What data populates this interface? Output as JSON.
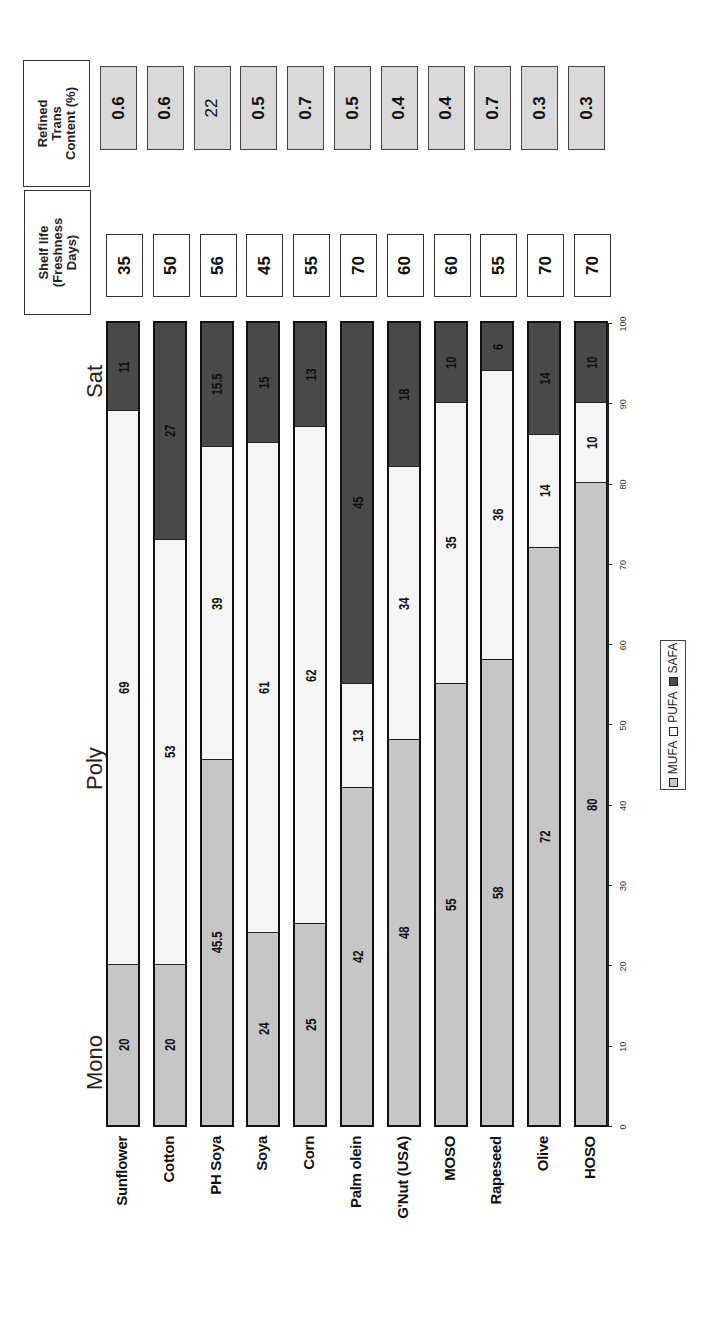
{
  "chart_data": {
    "type": "bar",
    "orientation": "horizontal-stacked (image rotated 90° counter-clockwise)",
    "categories": [
      "Sunflower",
      "Cotton",
      "PH Soya",
      "Soya",
      "Corn",
      "Palm olein",
      "G'Nut (USA)",
      "MOSO",
      "Rapeseed",
      "Olive",
      "HOSO"
    ],
    "series": [
      {
        "name": "MUFA",
        "color": "#c6c6c6",
        "values": [
          20,
          20,
          45.5,
          24,
          25,
          42,
          48,
          55,
          58,
          72,
          80
        ]
      },
      {
        "name": "PUFA",
        "color": "#f5f5f5",
        "values": [
          69,
          53,
          39,
          61,
          62,
          13,
          34,
          35,
          36,
          14,
          10
        ]
      },
      {
        "name": "SAFA",
        "color": "#4a4a4a",
        "values": [
          11,
          27,
          15.5,
          15,
          13,
          45,
          18,
          10,
          6,
          14,
          10
        ]
      }
    ],
    "group_labels": [
      "Mono",
      "Poly",
      "Sat"
    ],
    "xlim": [
      0,
      100
    ],
    "ticks": [
      "0",
      "10",
      "20",
      "30",
      "40",
      "50",
      "60",
      "70",
      "80",
      "90",
      "100"
    ],
    "legend": [
      "MUFA",
      "PUFA",
      "SAFA"
    ],
    "legend_position": "bottom",
    "grid": false,
    "side_columns": [
      {
        "title": "Shelf life (Freshness Days)",
        "values": [
          "35",
          "50",
          "56",
          "45",
          "55",
          "70",
          "60",
          "60",
          "55",
          "70",
          "70"
        ]
      },
      {
        "title": "Refined Trans Content (%)",
        "values": [
          "0.6",
          "0.6",
          "22",
          "0.5",
          "0.7",
          "0.5",
          "0.4",
          "0.4",
          "0.7",
          "0.3",
          "0.3"
        ]
      }
    ]
  },
  "headers": {
    "shelf_line1": "Shelf life",
    "shelf_line2": "(Freshness",
    "shelf_line3": "Days)",
    "trans_line1": "Refined",
    "trans_line2": "Trans",
    "trans_line3": "Content (%)"
  },
  "groups": {
    "mono": "Mono",
    "poly": "Poly",
    "sat": "Sat"
  },
  "legend": {
    "mufa": "MUFA",
    "pufa": "PUFA",
    "safa": "SAFA"
  }
}
